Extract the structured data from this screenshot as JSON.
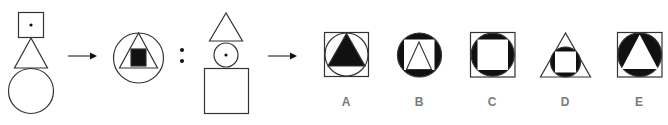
{
  "puzzle": {
    "type": "figure-analogy",
    "stroke_color": "#333333",
    "fill_color": "#111111",
    "label_color": "#7a7a7a",
    "arrow_symbol": "right-arrow",
    "separator_symbol": ":",
    "premise": {
      "left": {
        "description": "square with center dot, stacked above triangle, stacked above circle",
        "shapes": [
          "square-with-dot",
          "triangle",
          "circle"
        ]
      },
      "right": {
        "description": "circle containing triangle containing black square",
        "shapes": [
          "circle",
          "triangle",
          "black-square"
        ]
      }
    },
    "query": {
      "left": {
        "description": "triangle stacked above circle with center dot, stacked above square",
        "shapes": [
          "triangle",
          "circle-with-dot",
          "square"
        ]
      }
    },
    "options": [
      {
        "label": "A",
        "description": "square containing circle containing black triangle"
      },
      {
        "label": "B",
        "description": "black circle containing white square containing triangle"
      },
      {
        "label": "C",
        "description": "square containing black circle containing white square"
      },
      {
        "label": "D",
        "description": "triangle containing black circle containing white square"
      },
      {
        "label": "E",
        "description": "square containing black circle containing white triangle"
      }
    ]
  }
}
